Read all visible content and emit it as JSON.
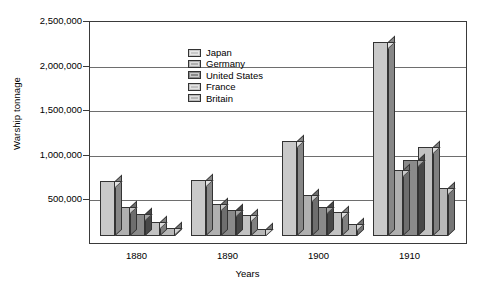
{
  "chart_data": {
    "type": "bar",
    "title": "",
    "subtitle": "",
    "xlabel": "Years",
    "ylabel": "Warship tonnage",
    "categories": [
      "1880",
      "1890",
      "1900",
      "1910"
    ],
    "ylim": [
      0,
      2500000
    ],
    "ytick_values": [
      0,
      500000,
      1000000,
      1500000,
      2000000,
      2500000
    ],
    "ytick_labels": [
      "",
      "500,000",
      "1,000,000",
      "1,500,000",
      "2,000,000",
      "2,500,000"
    ],
    "grid": true,
    "legend_position": "top-left inside plot",
    "style": "3d-bar",
    "series": [
      {
        "name": "Japan",
        "color": "#c9c9c9",
        "values": [
          620000,
          630000,
          1060000,
          2180000
        ]
      },
      {
        "name": "Germany",
        "color": "#b0b0b0",
        "values": [
          330000,
          360000,
          460000,
          740000
        ]
      },
      {
        "name": "United States",
        "color": "#8a8a8a",
        "values": [
          250000,
          290000,
          330000,
          850000
        ]
      },
      {
        "name": "France",
        "color": "#c2c2c2",
        "values": [
          160000,
          230000,
          270000,
          1000000
        ]
      },
      {
        "name": "Britain",
        "color": "#b8b8b8",
        "values": [
          90000,
          80000,
          130000,
          540000
        ]
      }
    ]
  },
  "legend": {
    "items": [
      {
        "label": "Japan"
      },
      {
        "label": "Germany"
      },
      {
        "label": "United States"
      },
      {
        "label": "France"
      },
      {
        "label": "Britain"
      }
    ]
  }
}
